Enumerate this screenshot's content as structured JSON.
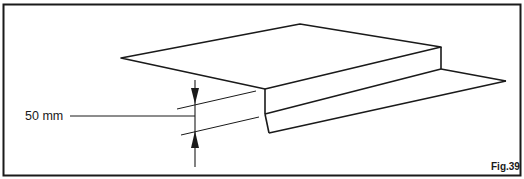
{
  "figure": {
    "label": "Fig.39",
    "dimension_label": "50 mm",
    "stroke_color": "#1a1a1a",
    "background_color": "#ffffff"
  }
}
